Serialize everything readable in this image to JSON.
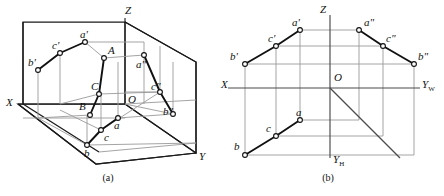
{
  "figure": {
    "captions": [
      {
        "id": "cap-a",
        "label": "(a)",
        "x": 98,
        "y": 168
      },
      {
        "id": "cap-b",
        "label": "(b)",
        "x": 318,
        "y": 168
      }
    ]
  },
  "panel_a": {
    "name": "axonometric-three-plane-view",
    "axis_labels": [
      {
        "name": "axis-label-z",
        "text": "Z",
        "x": 128,
        "y": 8
      },
      {
        "name": "axis-label-x",
        "text": "X",
        "x": 8,
        "y": 100
      },
      {
        "name": "axis-label-y",
        "text": "Y",
        "x": 201,
        "y": 157
      }
    ],
    "point_labels": [
      {
        "name": "point-label-a-prime",
        "text": "a'",
        "x": 88,
        "y": 33
      },
      {
        "name": "point-label-c-prime",
        "text": "c'",
        "x": 57,
        "y": 44
      },
      {
        "name": "point-label-b-prime",
        "text": "b'",
        "x": 33,
        "y": 58
      },
      {
        "name": "point-label-A",
        "text": "A",
        "x": 112,
        "y": 49
      },
      {
        "name": "point-label-a-double-prime",
        "text": "a\"",
        "x": 136,
        "y": 63
      },
      {
        "name": "point-label-C",
        "text": "C",
        "x": 96,
        "y": 86
      },
      {
        "name": "point-label-c-double-prime",
        "text": "c\"",
        "x": 152,
        "y": 88
      },
      {
        "name": "point-label-B",
        "text": "B",
        "x": 84,
        "y": 105
      },
      {
        "name": "point-label-O",
        "text": "O",
        "x": 131,
        "y": 99
      },
      {
        "name": "point-label-b-double-prime",
        "text": "b\"",
        "x": 163,
        "y": 112
      },
      {
        "name": "point-label-a",
        "text": "a",
        "x": 113,
        "y": 125
      },
      {
        "name": "point-label-c",
        "text": "c",
        "x": 103,
        "y": 137
      },
      {
        "name": "point-label-b",
        "text": "b",
        "x": 86,
        "y": 153
      }
    ],
    "vertices": {
      "a_prime": [
        85,
        42
      ],
      "c_prime": [
        60,
        53
      ],
      "b_prime": [
        38,
        70
      ],
      "A": [
        104,
        58
      ],
      "C": [
        99,
        94
      ],
      "B": [
        90,
        115
      ],
      "a_dblprime": [
        144,
        55
      ],
      "c_dblprime": [
        160,
        92
      ],
      "b_dblprime": [
        173,
        114
      ],
      "a": [
        118,
        118
      ],
      "c": [
        101,
        130
      ],
      "b": [
        87,
        145
      ],
      "O": [
        125,
        104
      ],
      "Z_top": [
        125,
        18
      ],
      "X_end": [
        18,
        104
      ],
      "Y_end": [
        196,
        153
      ]
    }
  },
  "panel_b": {
    "name": "orthographic-multiview-layout",
    "axis_labels": [
      {
        "name": "axis-label-z",
        "text": "Z",
        "x": 321,
        "y": 7
      },
      {
        "name": "axis-label-x",
        "text": "X",
        "x": 223,
        "y": 82
      },
      {
        "name": "axis-label-yw",
        "text": "Y",
        "sub": "W",
        "x": 424,
        "y": 83
      },
      {
        "name": "axis-label-yh",
        "text": "Y",
        "sub": "H",
        "x": 330,
        "y": 160
      }
    ],
    "point_labels": [
      {
        "name": "point-label-a-prime",
        "text": "a'",
        "x": 292,
        "y": 18
      },
      {
        "name": "point-label-a-double-prime",
        "text": "a\"",
        "x": 365,
        "y": 18
      },
      {
        "name": "point-label-c-prime",
        "text": "c'",
        "x": 268,
        "y": 33
      },
      {
        "name": "point-label-c-double-prime",
        "text": "c\"",
        "x": 386,
        "y": 33
      },
      {
        "name": "point-label-b-prime",
        "text": "b'",
        "x": 231,
        "y": 48
      },
      {
        "name": "point-label-b-double-prime",
        "text": "b\"",
        "x": 406,
        "y": 48
      },
      {
        "name": "point-label-O",
        "text": "O",
        "x": 336,
        "y": 78
      },
      {
        "name": "point-label-a",
        "text": "a",
        "x": 291,
        "y": 110
      },
      {
        "name": "point-label-c",
        "text": "c",
        "x": 262,
        "y": 127
      },
      {
        "name": "point-label-b",
        "text": "b",
        "x": 233,
        "y": 145
      }
    ],
    "vertices": {
      "a_prime": [
        300,
        30
      ],
      "c_prime": [
        276,
        46
      ],
      "b_prime": [
        245,
        64
      ],
      "a_dblprime": [
        359,
        30
      ],
      "c_dblprime": [
        383,
        46
      ],
      "b_dblprime": [
        414,
        64
      ],
      "a": [
        300,
        120
      ],
      "c": [
        276,
        136
      ],
      "b": [
        245,
        155
      ],
      "O": [
        330,
        88
      ]
    },
    "axis_extents": {
      "x_axis": [
        [
          228,
          88
        ],
        [
          330,
          88
        ]
      ],
      "yw_axis": [
        [
          330,
          88
        ],
        [
          420,
          88
        ]
      ],
      "z_axis": [
        [
          330,
          88
        ],
        [
          330,
          15
        ]
      ],
      "yh_axis": [
        [
          330,
          88
        ],
        [
          330,
          158
        ]
      ],
      "bisector": [
        [
          330,
          88
        ],
        [
          400,
          158
        ]
      ]
    }
  },
  "style": {
    "stroke_dark": "#1a1a1a",
    "stroke_light": "#9a9a9a",
    "vertex_fill": "#ffffff",
    "background": "#ffffff"
  }
}
